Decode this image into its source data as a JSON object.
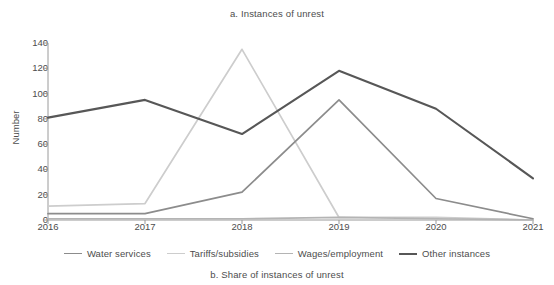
{
  "chart_data": {
    "type": "line",
    "title": "a. Instances of unrest",
    "caption": "b. Share of instances of unrest",
    "xlabel": "",
    "ylabel": "Number",
    "x": [
      2016,
      2017,
      2018,
      2019,
      2020,
      2021
    ],
    "xtick_labels": [
      "2016",
      "2017",
      "2018",
      "2019",
      "2020",
      "2021"
    ],
    "ytick_labels": [
      "0",
      "20",
      "40",
      "60",
      "80",
      "100",
      "120",
      "140"
    ],
    "yticks": [
      0,
      20,
      40,
      60,
      80,
      100,
      120,
      140
    ],
    "ylim": [
      0,
      140
    ],
    "xlim": [
      2016,
      2021
    ],
    "grid": false,
    "legend_position": "bottom",
    "series": [
      {
        "name": "Water services",
        "color": "#8c8c8c",
        "values": [
          5,
          5,
          22,
          95,
          17,
          1
        ]
      },
      {
        "name": "Tariffs/subsidies",
        "color": "#cdcdcd",
        "values": [
          11,
          13,
          135,
          2,
          2,
          0
        ]
      },
      {
        "name": "Wages/employment",
        "color": "#b4b4b4",
        "values": [
          1,
          1,
          1,
          2,
          1,
          0
        ]
      },
      {
        "name": "Other instances",
        "color": "#575757",
        "values": [
          81,
          95,
          68,
          118,
          88,
          33
        ]
      }
    ]
  }
}
